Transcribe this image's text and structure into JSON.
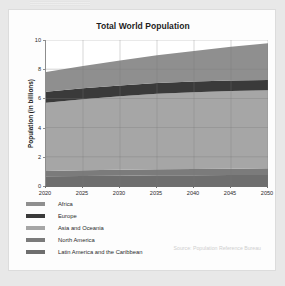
{
  "card": {
    "source_note": "Source: Population Reference Bureau"
  },
  "chart_data": {
    "type": "area",
    "title": "Total World Population",
    "xlabel": "",
    "ylabel": "Population (in billions)",
    "x": [
      2020,
      2025,
      2030,
      2035,
      2040,
      2045,
      2050
    ],
    "xlim": [
      2020,
      2050
    ],
    "ylim": [
      0,
      10
    ],
    "xticks": [
      "2020",
      "2025",
      "2030",
      "2035",
      "2040",
      "2045",
      "2050"
    ],
    "yticks": [
      "0",
      "2",
      "4",
      "6",
      "8",
      "10"
    ],
    "grid": true,
    "stacked": true,
    "legend_position": "below",
    "series": [
      {
        "name": "Latin America and the Caribbean",
        "color": "#6e6e6e",
        "values": [
          0.66,
          0.69,
          0.71,
          0.73,
          0.74,
          0.75,
          0.76
        ]
      },
      {
        "name": "North America",
        "color": "#7b7b7b",
        "values": [
          0.37,
          0.39,
          0.4,
          0.42,
          0.43,
          0.44,
          0.45
        ]
      },
      {
        "name": "Asia and Oceania",
        "color": "#a6a6a6",
        "values": [
          4.68,
          4.87,
          5.03,
          5.16,
          5.25,
          5.31,
          5.34
        ]
      },
      {
        "name": "Europe",
        "color": "#3a3a3a",
        "values": [
          0.75,
          0.75,
          0.75,
          0.74,
          0.73,
          0.72,
          0.71
        ]
      },
      {
        "name": "Africa",
        "color": "#8f8f8f",
        "values": [
          1.34,
          1.52,
          1.71,
          1.9,
          2.1,
          2.31,
          2.51
        ]
      }
    ],
    "totals": [
      7.8,
      8.22,
      8.6,
      8.95,
      9.25,
      9.53,
      9.77
    ]
  },
  "legend": {
    "items": [
      {
        "label": "Africa",
        "color": "#8f8f8f"
      },
      {
        "label": "Europe",
        "color": "#3a3a3a"
      },
      {
        "label": "Asia and Oceania",
        "color": "#a6a6a6"
      },
      {
        "label": "North America",
        "color": "#7b7b7b"
      },
      {
        "label": "Latin America and the Caribbean",
        "color": "#6e6e6e"
      }
    ]
  }
}
